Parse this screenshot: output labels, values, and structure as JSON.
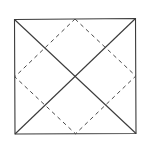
{
  "diagram": {
    "type": "geometric-figure",
    "colors": {
      "background": "#ffffff",
      "solid_stroke": "#3a3a3a",
      "dashed_stroke": "#4a4a4a"
    },
    "outer_square": {
      "corners": {
        "top_left": [
          14.5,
          19.5
        ],
        "top_right": [
          135.5,
          18.5
        ],
        "bottom_right": [
          136,
          133.5
        ],
        "bottom_left": [
          15,
          134
        ]
      }
    },
    "diagonals": [
      {
        "from": "top_left",
        "to": "bottom_right"
      },
      {
        "from": "top_right",
        "to": "bottom_left"
      }
    ],
    "inner_dashed_square": {
      "vertices": {
        "top_mid": [
          75,
          19
        ],
        "right_mid": [
          135.8,
          76
        ],
        "bottom_mid": [
          75.5,
          133.8
        ],
        "left_mid": [
          14.8,
          76.8
        ]
      }
    },
    "center": [
      75.3,
      76.4
    ]
  }
}
